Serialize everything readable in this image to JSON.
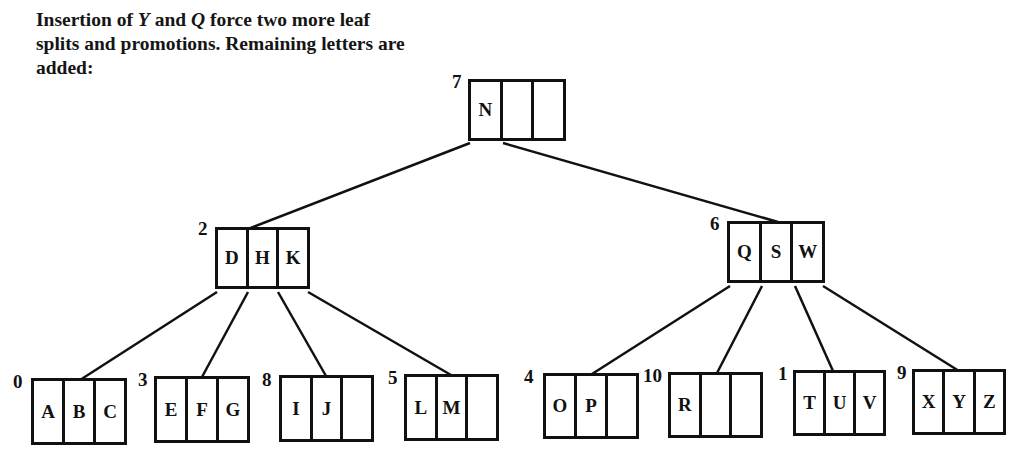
{
  "caption": {
    "part1": "Insertion of ",
    "y": "Y",
    "part2": " and ",
    "q": "Q",
    "part3": " force two more leaf splits and promotions. Remaining letters are added:"
  },
  "tree": {
    "root": {
      "id": "7",
      "keys": [
        "N",
        "",
        ""
      ]
    },
    "level1": [
      {
        "id": "2",
        "keys": [
          "D",
          "H",
          "K"
        ]
      },
      {
        "id": "6",
        "keys": [
          "Q",
          "S",
          "W"
        ]
      }
    ],
    "leaves": [
      {
        "id": "0",
        "keys": [
          "A",
          "B",
          "C"
        ]
      },
      {
        "id": "3",
        "keys": [
          "E",
          "F",
          "G"
        ]
      },
      {
        "id": "8",
        "keys": [
          "I",
          "J",
          ""
        ]
      },
      {
        "id": "5",
        "keys": [
          "L",
          "M",
          ""
        ]
      },
      {
        "id": "4",
        "keys": [
          "O",
          "P",
          ""
        ]
      },
      {
        "id": "10",
        "keys": [
          "R",
          "",
          ""
        ]
      },
      {
        "id": "1",
        "keys": [
          "T",
          "U",
          "V"
        ]
      },
      {
        "id": "9",
        "keys": [
          "X",
          "Y",
          "Z"
        ]
      }
    ]
  }
}
